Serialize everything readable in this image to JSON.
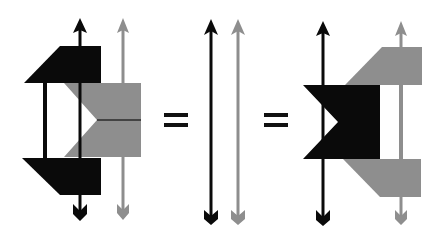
{
  "diagram": {
    "colors": {
      "black": "#0a0a0a",
      "gray": "#8e8e8e",
      "background": "#ffffff"
    },
    "equals_signs": [
      "=",
      "="
    ],
    "panels": [
      {
        "name": "left-configuration",
        "strands": [
          "black",
          "gray"
        ]
      },
      {
        "name": "identity-strands",
        "strands": [
          "black",
          "gray"
        ]
      },
      {
        "name": "right-configuration",
        "strands": [
          "black",
          "gray"
        ]
      }
    ]
  }
}
